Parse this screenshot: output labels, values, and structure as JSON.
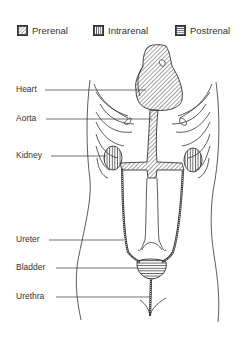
{
  "legend": [
    {
      "label": "Prerenal",
      "pattern": "diagonal-hatch"
    },
    {
      "label": "Intrarenal",
      "pattern": "vertical-hatch"
    },
    {
      "label": "Postrenal",
      "pattern": "horizontal-hatch"
    }
  ],
  "labels": [
    {
      "text": "Heart",
      "target": "heart",
      "category": "Prerenal"
    },
    {
      "text": "Aorta",
      "target": "aorta",
      "category": "Prerenal"
    },
    {
      "text": "Kidney",
      "target": "kidney",
      "category": "Intrarenal"
    },
    {
      "text": "Ureter",
      "target": "ureter",
      "category": "Postrenal"
    },
    {
      "text": "Bladder",
      "target": "bladder",
      "category": "Postrenal"
    },
    {
      "text": "Urethra",
      "target": "urethra",
      "category": "Postrenal"
    }
  ],
  "colors": {
    "line": "#333333",
    "background": "#ffffff"
  }
}
